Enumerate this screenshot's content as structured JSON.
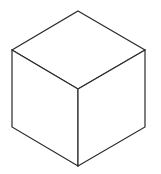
{
  "diagram": {
    "type": "isometric-cube-line-drawing",
    "background": "#ffffff",
    "stroke_color": "#2a2a2a",
    "stroke_width": 1.2,
    "vertices": {
      "top": [
        78,
        11
      ],
      "left": [
        12,
        50
      ],
      "right": [
        145,
        50
      ],
      "center": [
        78,
        89
      ],
      "bottom_left": [
        12,
        127
      ],
      "bottom_right": [
        145,
        127
      ],
      "bottom": [
        78,
        166
      ]
    },
    "faces": [
      {
        "name": "top-face",
        "points": [
          "top",
          "right",
          "center",
          "left"
        ]
      },
      {
        "name": "left-face",
        "points": [
          "left",
          "center",
          "bottom",
          "bottom_left"
        ]
      },
      {
        "name": "right-face",
        "points": [
          "center",
          "right",
          "bottom_right",
          "bottom"
        ]
      }
    ]
  }
}
